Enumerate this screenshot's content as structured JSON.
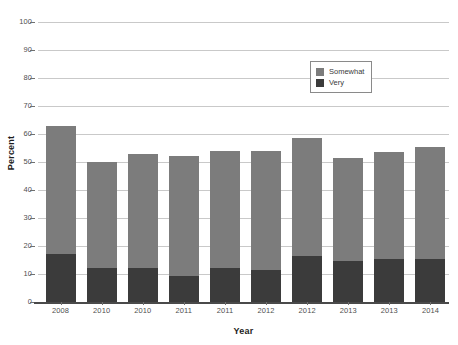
{
  "chart_data": {
    "type": "bar",
    "subtype": "stacked-vertical",
    "title": "",
    "xlabel": "Year",
    "ylabel": "Percent",
    "ylim": [
      0,
      100
    ],
    "ytick_step": 10,
    "yticks": [
      "0",
      "10",
      "20",
      "30",
      "40",
      "50",
      "60",
      "70",
      "80",
      "90",
      "100"
    ],
    "grid": true,
    "grid_axis": "y",
    "legend_position": "upper-right-inside",
    "categories": [
      "2008",
      "2010",
      "2010",
      "2011",
      "2011",
      "2012",
      "2012",
      "2013",
      "2013",
      "2014"
    ],
    "series": [
      {
        "name": "Very",
        "color": "#3b3b3b",
        "values": [
          17,
          12,
          12,
          9.3,
          12.3,
          11.3,
          16.5,
          14.7,
          15.3,
          15.3
        ]
      },
      {
        "name": "Somewhat",
        "color": "#7c7c7c",
        "values": [
          46,
          38,
          41,
          42.7,
          41.7,
          42.7,
          42,
          36.8,
          38.2,
          40.2
        ]
      }
    ],
    "totals": [
      63,
      50,
      53,
      52,
      54,
      54,
      58.5,
      51.5,
      53.5,
      55.5
    ]
  },
  "legend": {
    "items": [
      {
        "label": "Somewhat",
        "swatch": "legend-swatch-somewhat"
      },
      {
        "label": "Very",
        "swatch": "legend-swatch-very"
      }
    ]
  },
  "colors": {
    "somewhat": "#7c7c7c",
    "very": "#3b3b3b",
    "gridline": "#c9c9c9",
    "axis": "#4a4a4a",
    "text": "#4f4f4f",
    "background": "#ffffff"
  }
}
